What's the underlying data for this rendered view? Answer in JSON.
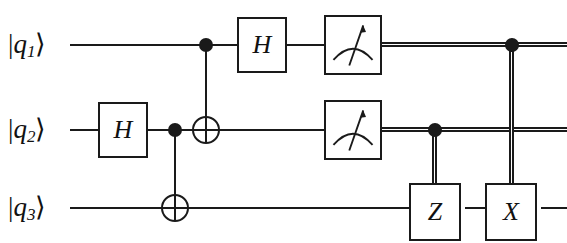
{
  "diagram": {
    "background_color": "#ffffff",
    "ink_color": "#1a1a1a",
    "width": 567,
    "height": 243
  },
  "qubits": [
    {
      "id": "q1",
      "label_bar": "|",
      "label_name": "q",
      "label_sub": "1",
      "label_ket": "⟩",
      "y": 45
    },
    {
      "id": "q2",
      "label_bar": "|",
      "label_name": "q",
      "label_sub": "2",
      "label_ket": "⟩",
      "y": 130
    },
    {
      "id": "q3",
      "label_bar": "|",
      "label_name": "q",
      "label_sub": "3",
      "label_ket": "⟩",
      "y": 208
    }
  ],
  "gates": {
    "hadamard_q2": {
      "label": "H",
      "wire": "q2",
      "x": 98,
      "y": 130
    },
    "hadamard_q1": {
      "label": "H",
      "wire": "q1",
      "x": 237,
      "y": 45
    },
    "pauli_z": {
      "label": "Z",
      "wire": "q3",
      "x": 409,
      "y": 208
    },
    "pauli_x": {
      "label": "X",
      "wire": "q3",
      "x": 485,
      "y": 208
    }
  },
  "measurements": [
    {
      "id": "measure-q1",
      "wire": "q1",
      "x": 324,
      "y": 45
    },
    {
      "id": "measure-q2",
      "wire": "q2",
      "x": 324,
      "y": 130
    }
  ],
  "cnots": [
    {
      "id": "cnot-q2-q3",
      "control_wire": "q2",
      "target_wire": "q3",
      "x": 175,
      "control_y": 130,
      "target_y": 208
    },
    {
      "id": "cnot-q1-q2",
      "control_wire": "q1",
      "target_wire": "q2",
      "x": 206,
      "control_y": 45,
      "target_y": 130
    }
  ],
  "classical_controls": [
    {
      "id": "cctrl-q2-to-z",
      "source_wire": "q2",
      "target_gate": "Z",
      "x": 435,
      "from_y": 130,
      "to_y": 183
    },
    {
      "id": "cctrl-q1-to-x",
      "source_wire": "q1",
      "target_gate": "X",
      "x": 512,
      "from_y": 45,
      "to_y": 183
    }
  ],
  "legend": {
    "hadamard": "hadamard-gate",
    "measure": "measurement-gate",
    "control": "control-dot",
    "target": "cnot-target",
    "classical_wire": "classical-double-wire",
    "quantum_wire": "quantum-single-wire"
  }
}
